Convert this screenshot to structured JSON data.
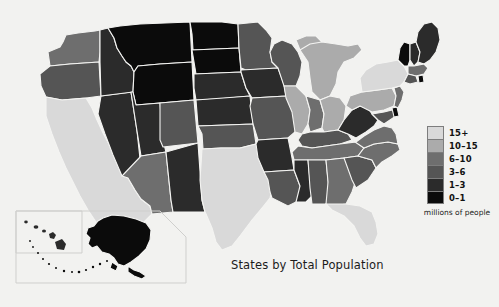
{
  "title": "States by Total Population",
  "legend": {
    "caption": "millions of people",
    "items": [
      {
        "label": "15+",
        "color": "#d9d9d9",
        "min": 15,
        "max": null
      },
      {
        "label": "10–15",
        "color": "#ababab",
        "min": 10,
        "max": 15
      },
      {
        "label": "6–10",
        "color": "#6e6e6e",
        "min": 6,
        "max": 10
      },
      {
        "label": "3–6",
        "color": "#555555",
        "min": 3,
        "max": 6
      },
      {
        "label": "1–3",
        "color": "#2b2b2b",
        "min": 1,
        "max": 3
      },
      {
        "label": "0–1",
        "color": "#0b0b0b",
        "min": 0,
        "max": 1
      }
    ]
  },
  "chart_data": {
    "type": "map",
    "title": "States by Total Population",
    "ylabel": "millions of people",
    "legend_position": "right",
    "categories": [
      "15+",
      "10-15",
      "6-10",
      "3-6",
      "1-3",
      "0-1"
    ],
    "states": [
      {
        "name": "Washington",
        "abbr": "WA",
        "bin": "6-10",
        "color": "#6e6e6e"
      },
      {
        "name": "Oregon",
        "abbr": "OR",
        "bin": "3-6",
        "color": "#555555"
      },
      {
        "name": "California",
        "abbr": "CA",
        "bin": "15+",
        "color": "#d9d9d9"
      },
      {
        "name": "Idaho",
        "abbr": "ID",
        "bin": "1-3",
        "color": "#2b2b2b"
      },
      {
        "name": "Nevada",
        "abbr": "NV",
        "bin": "1-3",
        "color": "#2b2b2b"
      },
      {
        "name": "Montana",
        "abbr": "MT",
        "bin": "0-1",
        "color": "#0b0b0b"
      },
      {
        "name": "Wyoming",
        "abbr": "WY",
        "bin": "0-1",
        "color": "#0b0b0b"
      },
      {
        "name": "Utah",
        "abbr": "UT",
        "bin": "1-3",
        "color": "#2b2b2b"
      },
      {
        "name": "Arizona",
        "abbr": "AZ",
        "bin": "6-10",
        "color": "#6e6e6e"
      },
      {
        "name": "Colorado",
        "abbr": "CO",
        "bin": "3-6",
        "color": "#555555"
      },
      {
        "name": "New Mexico",
        "abbr": "NM",
        "bin": "1-3",
        "color": "#2b2b2b"
      },
      {
        "name": "North Dakota",
        "abbr": "ND",
        "bin": "0-1",
        "color": "#0b0b0b"
      },
      {
        "name": "South Dakota",
        "abbr": "SD",
        "bin": "0-1",
        "color": "#0b0b0b"
      },
      {
        "name": "Nebraska",
        "abbr": "NE",
        "bin": "1-3",
        "color": "#2b2b2b"
      },
      {
        "name": "Kansas",
        "abbr": "KS",
        "bin": "1-3",
        "color": "#2b2b2b"
      },
      {
        "name": "Oklahoma",
        "abbr": "OK",
        "bin": "3-6",
        "color": "#555555"
      },
      {
        "name": "Texas",
        "abbr": "TX",
        "bin": "15+",
        "color": "#d9d9d9"
      },
      {
        "name": "Minnesota",
        "abbr": "MN",
        "bin": "3-6",
        "color": "#555555"
      },
      {
        "name": "Iowa",
        "abbr": "IA",
        "bin": "1-3",
        "color": "#2b2b2b"
      },
      {
        "name": "Missouri",
        "abbr": "MO",
        "bin": "3-6",
        "color": "#555555"
      },
      {
        "name": "Arkansas",
        "abbr": "AR",
        "bin": "1-3",
        "color": "#2b2b2b"
      },
      {
        "name": "Louisiana",
        "abbr": "LA",
        "bin": "3-6",
        "color": "#555555"
      },
      {
        "name": "Wisconsin",
        "abbr": "WI",
        "bin": "3-6",
        "color": "#555555"
      },
      {
        "name": "Illinois",
        "abbr": "IL",
        "bin": "10-15",
        "color": "#ababab"
      },
      {
        "name": "Michigan",
        "abbr": "MI",
        "bin": "10-15",
        "color": "#ababab"
      },
      {
        "name": "Indiana",
        "abbr": "IN",
        "bin": "6-10",
        "color": "#6e6e6e"
      },
      {
        "name": "Ohio",
        "abbr": "OH",
        "bin": "10-15",
        "color": "#ababab"
      },
      {
        "name": "Kentucky",
        "abbr": "KY",
        "bin": "3-6",
        "color": "#555555"
      },
      {
        "name": "Tennessee",
        "abbr": "TN",
        "bin": "6-10",
        "color": "#6e6e6e"
      },
      {
        "name": "Mississippi",
        "abbr": "MS",
        "bin": "1-3",
        "color": "#2b2b2b"
      },
      {
        "name": "Alabama",
        "abbr": "AL",
        "bin": "3-6",
        "color": "#555555"
      },
      {
        "name": "Georgia",
        "abbr": "GA",
        "bin": "6-10",
        "color": "#6e6e6e"
      },
      {
        "name": "Florida",
        "abbr": "FL",
        "bin": "15+",
        "color": "#d9d9d9"
      },
      {
        "name": "South Carolina",
        "abbr": "SC",
        "bin": "3-6",
        "color": "#555555"
      },
      {
        "name": "North Carolina",
        "abbr": "NC",
        "bin": "6-10",
        "color": "#6e6e6e"
      },
      {
        "name": "Virginia",
        "abbr": "VA",
        "bin": "6-10",
        "color": "#6e6e6e"
      },
      {
        "name": "West Virginia",
        "abbr": "WV",
        "bin": "1-3",
        "color": "#2b2b2b"
      },
      {
        "name": "Maryland",
        "abbr": "MD",
        "bin": "3-6",
        "color": "#555555"
      },
      {
        "name": "Delaware",
        "abbr": "DE",
        "bin": "0-1",
        "color": "#0b0b0b"
      },
      {
        "name": "Pennsylvania",
        "abbr": "PA",
        "bin": "10-15",
        "color": "#ababab"
      },
      {
        "name": "New Jersey",
        "abbr": "NJ",
        "bin": "6-10",
        "color": "#6e6e6e"
      },
      {
        "name": "New York",
        "abbr": "NY",
        "bin": "15+",
        "color": "#d9d9d9"
      },
      {
        "name": "Connecticut",
        "abbr": "CT",
        "bin": "3-6",
        "color": "#555555"
      },
      {
        "name": "Rhode Island",
        "abbr": "RI",
        "bin": "0-1",
        "color": "#0b0b0b"
      },
      {
        "name": "Massachusetts",
        "abbr": "MA",
        "bin": "6-10",
        "color": "#6e6e6e"
      },
      {
        "name": "Vermont",
        "abbr": "VT",
        "bin": "0-1",
        "color": "#0b0b0b"
      },
      {
        "name": "New Hampshire",
        "abbr": "NH",
        "bin": "1-3",
        "color": "#2b2b2b"
      },
      {
        "name": "Maine",
        "abbr": "ME",
        "bin": "1-3",
        "color": "#2b2b2b"
      },
      {
        "name": "Alaska",
        "abbr": "AK",
        "bin": "0-1",
        "color": "#0b0b0b"
      },
      {
        "name": "Hawaii",
        "abbr": "HI",
        "bin": "1-3",
        "color": "#2b2b2b"
      }
    ]
  }
}
